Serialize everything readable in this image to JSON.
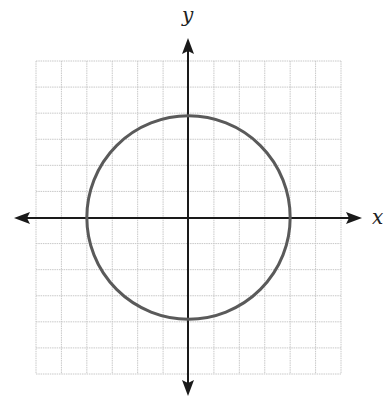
{
  "figure": {
    "x_axis_label": "x",
    "y_axis_label": "y",
    "colors": {
      "grid": "#c8c8c8",
      "axis": "#1a1a1a",
      "curve": "#5a5a5a",
      "background": "#ffffff"
    }
  },
  "chart_data": {
    "type": "line",
    "title": "",
    "subtitle": "",
    "xlabel": "x",
    "ylabel": "y",
    "xlim": [
      -6,
      6
    ],
    "ylim": [
      -6,
      6
    ],
    "grid": true,
    "grid_spacing": 1,
    "tick_labels": false,
    "legend": null,
    "axes_arrows": true,
    "series": [
      {
        "name": "circle",
        "shape": "circle",
        "equation": "x^2 + y^2 = 16",
        "center": [
          0,
          0
        ],
        "radius": 4,
        "key_points": [
          [
            4,
            0
          ],
          [
            0,
            4
          ],
          [
            -4,
            0
          ],
          [
            0,
            -4
          ]
        ]
      }
    ]
  }
}
